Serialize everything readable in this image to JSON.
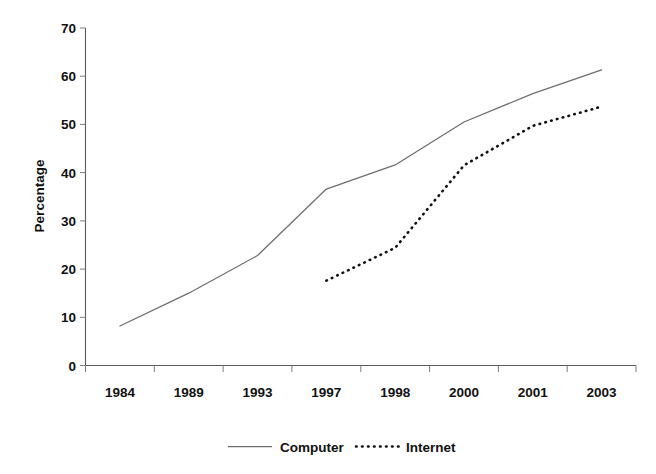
{
  "chart_data": {
    "type": "line",
    "title": "",
    "xlabel": "",
    "ylabel": "Percentage",
    "categories": [
      "1984",
      "1989",
      "1993",
      "1997",
      "1998",
      "2000",
      "2001",
      "2003"
    ],
    "ylim": [
      0,
      70
    ],
    "yticks": [
      "0",
      "10",
      "20",
      "30",
      "40",
      "50",
      "60",
      "70"
    ],
    "grid": false,
    "legend_position": "bottom-center",
    "series": [
      {
        "name": "Computer",
        "style": "solid",
        "color": "#6e6e6e",
        "values": [
          8.2,
          15.0,
          22.8,
          36.6,
          41.6,
          50.5,
          56.4,
          61.3
        ]
      },
      {
        "name": "Internet",
        "style": "dotted",
        "color": "#111111",
        "values": [
          null,
          null,
          null,
          17.6,
          24.4,
          41.5,
          49.7,
          53.7
        ]
      }
    ]
  },
  "axes": {
    "y_title": "Percentage"
  },
  "legend": {
    "computer_label": "Computer",
    "internet_label": "Internet"
  }
}
